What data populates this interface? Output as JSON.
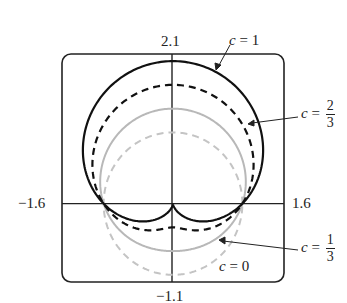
{
  "chart_data": {
    "type": "line",
    "title": "",
    "xlabel": "",
    "ylabel": "",
    "xlim": [
      -1.6,
      1.6
    ],
    "ylim": [
      -1.1,
      2.1
    ],
    "grid": false,
    "equation_form": "r = 1 + c sin(theta) (polar)",
    "tick_labels": {
      "x_min": "−1.6",
      "x_max": "1.6",
      "y_min": "−1.1",
      "y_max": "2.1"
    },
    "series": [
      {
        "name": "c = 1",
        "c": 1,
        "style": "solid",
        "color": "#111111",
        "width": 2.2,
        "top_y": 2.0,
        "bottom_y": 0.0
      },
      {
        "name": "c = 2/3",
        "c": 0.6667,
        "style": "dashed",
        "color": "#111111",
        "width": 2.2,
        "top_y": 1.667,
        "bottom_y": -0.333
      },
      {
        "name": "c = 1/3",
        "c": 0.3333,
        "style": "solid",
        "color": "#b8b8b8",
        "width": 2.0,
        "top_y": 1.333,
        "bottom_y": -0.667
      },
      {
        "name": "c = 0",
        "c": 0,
        "style": "dashed",
        "color": "#c4c4c4",
        "width": 2.0,
        "top_y": 1.0,
        "bottom_y": -1.0
      }
    ],
    "annotations": [
      {
        "text": "c = 1",
        "points_to": "c = 1 curve upper right"
      },
      {
        "text": "c = 2/3",
        "points_to": "c = 2/3 curve right side"
      },
      {
        "text": "c = 1/3",
        "points_to": "c = 1/3 curve lower right"
      },
      {
        "text": "c = 0",
        "points_to": "c = 0 curve bottom"
      }
    ]
  },
  "labels": {
    "y_max": "2.1",
    "y_min": "−1.1",
    "x_min": "−1.6",
    "x_max": "1.6",
    "c1": {
      "var": "c",
      "eq": " = 1"
    },
    "c23": {
      "var": "c",
      "eq": " = ",
      "num": "2",
      "den": "3"
    },
    "c13": {
      "var": "c",
      "eq": " = ",
      "num": "1",
      "den": "3"
    },
    "c0": {
      "var": "c",
      "eq": " = 0"
    }
  }
}
